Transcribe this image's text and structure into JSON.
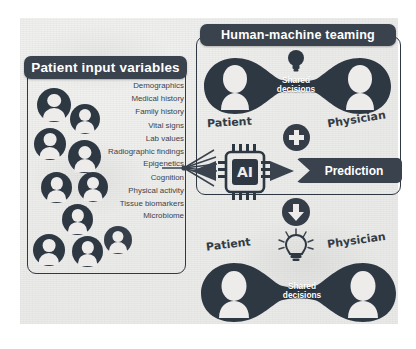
{
  "figure": {
    "title_top_panel": "Human-machine teaming",
    "title_left_panel": "Patient input variables"
  },
  "left_panel": {
    "header": "Patient input variables",
    "variables": [
      "Demographics",
      "Medical history",
      "Family history",
      "Vital signs",
      "Lab values",
      "Radiographic findings",
      "Epigenetics",
      "Cognition",
      "Physical activity",
      "Tissue biomarkers",
      "Microbiome"
    ],
    "avatar_icon": "person-avatar-icon",
    "avatar_count": 10
  },
  "top_panel": {
    "header": "Human-machine teaming",
    "left_label": "Patient",
    "right_label": "Physician",
    "center_label_line1": "Shared",
    "center_label_line2": "decisions",
    "bulb_icon": "lightbulb-icon-unlit"
  },
  "middle_row": {
    "chip_label": "AI",
    "chip_icon": "microchip-icon",
    "plus_icon": "plus-circle-icon",
    "arrow_icon": "arrow-down-circle-icon",
    "prediction_label": "Prediction"
  },
  "bottom_panel": {
    "left_label": "Patient",
    "right_label": "Physician",
    "center_label_line1": "Shared",
    "center_label_line2": "decisions",
    "bulb_icon": "lightbulb-icon-lit"
  },
  "colors": {
    "ink": "#2e3843",
    "header_bar": "#39424d",
    "paper": "#ecebe9",
    "highlight": "#edeceb"
  }
}
